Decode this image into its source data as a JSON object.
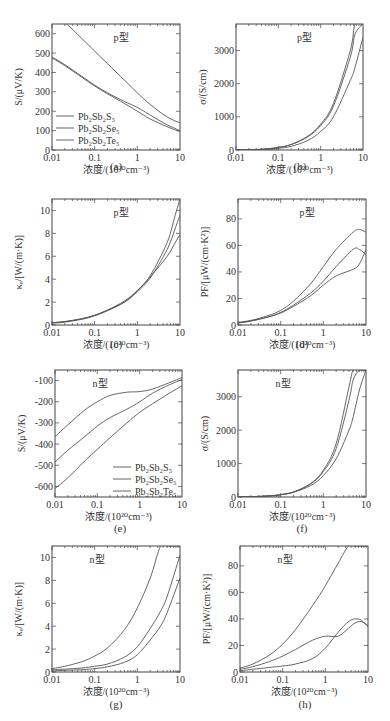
{
  "figure": {
    "xlabel": "浓度/(10²⁰cm⁻³)",
    "xticks": [
      "0.01",
      "0.1",
      "1",
      "10"
    ],
    "legend": [
      "Pb₂Sb₂S₅",
      "Pb₂Sb₂Se₅",
      "Pb₂Sb₂Te₅"
    ],
    "line_color": "#555555"
  },
  "chart_data": [
    {
      "id": "a",
      "panel_label": "(a)",
      "type": "line",
      "title": "p型",
      "ylabel": "S/(μV/K)",
      "xlabel": "浓度/(10²⁰cm⁻³)",
      "xscale": "log",
      "xlim": [
        0.01,
        10
      ],
      "ylim": [
        0,
        650
      ],
      "yticks": [
        0,
        100,
        200,
        300,
        400,
        500,
        600
      ],
      "legend_position": "lower-left",
      "x": [
        0.01,
        0.02,
        0.05,
        0.1,
        0.2,
        0.5,
        1,
        2,
        5,
        10
      ],
      "series": [
        {
          "name": "Pb₂Sb₂S₅",
          "values": [
            720,
            660,
            575,
            510,
            445,
            360,
            295,
            235,
            170,
            140
          ]
        },
        {
          "name": "Pb₂Sb₂Se₅",
          "values": [
            480,
            440,
            380,
            335,
            295,
            250,
            220,
            180,
            130,
            100
          ]
        },
        {
          "name": "Pb₂Sb₂Te₅",
          "values": [
            475,
            435,
            375,
            330,
            290,
            240,
            200,
            160,
            120,
            95
          ]
        }
      ]
    },
    {
      "id": "b",
      "panel_label": "(b)",
      "type": "line",
      "title": "p型",
      "ylabel": "σ/(S/cm)",
      "xlabel": "浓度/(10²⁰cm⁻³)",
      "xscale": "log",
      "xlim": [
        0.01,
        10
      ],
      "ylim": [
        0,
        3800
      ],
      "yticks": [
        0,
        1000,
        2000,
        3000
      ],
      "x": [
        0.01,
        0.02,
        0.05,
        0.1,
        0.2,
        0.5,
        1,
        2,
        5,
        6.5,
        10
      ],
      "series": [
        {
          "name": "Pb₂Sb₂S₅",
          "values": [
            5,
            10,
            30,
            80,
            170,
            420,
            780,
            1400,
            3000,
            3800,
            3800
          ]
        },
        {
          "name": "Pb₂Sb₂Se₅",
          "values": [
            5,
            10,
            30,
            75,
            160,
            400,
            740,
            1320,
            2800,
            3500,
            3800
          ]
        },
        {
          "name": "Pb₂Sb₂Te₅",
          "values": [
            3,
            8,
            20,
            50,
            110,
            290,
            560,
            1000,
            2100,
            2500,
            3400
          ]
        }
      ]
    },
    {
      "id": "c",
      "panel_label": "(c)",
      "type": "line",
      "title": "p型",
      "ylabel": "κₑ/[W/(m·K)]",
      "xlabel": "浓度/(10²⁰cm⁻³)",
      "xscale": "log",
      "xlim": [
        0.01,
        10
      ],
      "ylim": [
        0,
        11
      ],
      "yticks": [
        0,
        2,
        4,
        6,
        8,
        10
      ],
      "x": [
        0.01,
        0.02,
        0.05,
        0.1,
        0.2,
        0.5,
        1,
        2,
        5,
        8,
        10
      ],
      "series": [
        {
          "name": "Pb₂Sb₂S₅",
          "values": [
            0.2,
            0.3,
            0.55,
            0.85,
            1.3,
            2.1,
            3.0,
            4.3,
            7.2,
            9.8,
            11
          ]
        },
        {
          "name": "Pb₂Sb₂Se₅",
          "values": [
            0.2,
            0.3,
            0.55,
            0.85,
            1.3,
            2.0,
            2.9,
            4.1,
            6.6,
            8.6,
            9.6
          ]
        },
        {
          "name": "Pb₂Sb₂Te₅",
          "values": [
            0.15,
            0.25,
            0.5,
            0.8,
            1.25,
            2.0,
            3.0,
            4.2,
            6.0,
            7.3,
            7.9
          ]
        }
      ]
    },
    {
      "id": "d",
      "panel_label": "(d)",
      "type": "line",
      "title": "p型",
      "ylabel": "PF/[μW/(cm·K²)]",
      "xlabel": "浓度/(10²⁰cm⁻³)",
      "xscale": "log",
      "xlim": [
        0.01,
        10
      ],
      "ylim": [
        0,
        95
      ],
      "yticks": [
        0,
        20,
        40,
        60,
        80
      ],
      "x": [
        0.01,
        0.02,
        0.05,
        0.1,
        0.2,
        0.5,
        1,
        2,
        5,
        7,
        10
      ],
      "series": [
        {
          "name": "Pb₂Sb₂S₅",
          "values": [
            2,
            3.5,
            7,
            11,
            18,
            31,
            44,
            57,
            70,
            72,
            70
          ]
        },
        {
          "name": "Pb₂Sb₂Se₅",
          "values": [
            1.5,
            3,
            6,
            9.5,
            15,
            24,
            33,
            44,
            57,
            57,
            53
          ]
        },
        {
          "name": "Pb₂Sb₂Te₅",
          "values": [
            1.5,
            3,
            6,
            9,
            14,
            22,
            30,
            37,
            42,
            46,
            57
          ]
        }
      ]
    },
    {
      "id": "e",
      "panel_label": "(e)",
      "type": "line",
      "title": "n型",
      "ylabel": "S/(μV/K)",
      "xlabel": "浓度/(10²⁰cm⁻³)",
      "xscale": "log",
      "xlim": [
        0.01,
        10
      ],
      "ylim": [
        -650,
        -50
      ],
      "yticks": [
        -600,
        -500,
        -400,
        -300,
        -200,
        -100
      ],
      "legend_position": "lower-right",
      "x": [
        0.01,
        0.02,
        0.05,
        0.1,
        0.2,
        0.5,
        1,
        2,
        5,
        10
      ],
      "series": [
        {
          "name": "Pb₂Sb₂S₅",
          "values": [
            -365,
            -310,
            -240,
            -200,
            -170,
            -155,
            -152,
            -140,
            -110,
            -85
          ]
        },
        {
          "name": "Pb₂Sb₂Se₅",
          "values": [
            -485,
            -430,
            -365,
            -315,
            -275,
            -235,
            -200,
            -160,
            -120,
            -95
          ]
        },
        {
          "name": "Pb₂Sb₂Te₅",
          "values": [
            -610,
            -560,
            -480,
            -425,
            -370,
            -300,
            -250,
            -210,
            -160,
            -125
          ]
        }
      ]
    },
    {
      "id": "f",
      "panel_label": "(f)",
      "type": "line",
      "title": "n型",
      "ylabel": "σ/(S/cm)",
      "xlabel": "浓度/(10²⁰cm⁻³)",
      "xscale": "log",
      "xlim": [
        0.01,
        10
      ],
      "ylim": [
        0,
        3800
      ],
      "yticks": [
        0,
        1000,
        2000,
        3000
      ],
      "x": [
        0.01,
        0.02,
        0.05,
        0.1,
        0.2,
        0.5,
        1,
        2,
        4,
        5,
        7,
        10
      ],
      "series": [
        {
          "name": "Pb₂Sb₂S₅",
          "values": [
            5,
            10,
            30,
            70,
            150,
            400,
            800,
            1600,
            3300,
            3800,
            3800,
            3800
          ]
        },
        {
          "name": "Pb₂Sb₂Se₅",
          "values": [
            5,
            10,
            30,
            70,
            150,
            390,
            760,
            1450,
            2900,
            3500,
            3800,
            3800
          ]
        },
        {
          "name": "Pb₂Sb₂Te₅",
          "values": [
            5,
            10,
            30,
            70,
            140,
            340,
            640,
            1150,
            2000,
            2400,
            3200,
            3800
          ]
        }
      ]
    },
    {
      "id": "g",
      "panel_label": "(g)",
      "type": "line",
      "title": "n型",
      "ylabel": "κₑ/[W/(m·K)]",
      "xlabel": "浓度/(10²⁰cm⁻³)",
      "xscale": "log",
      "xlim": [
        0.01,
        10
      ],
      "ylim": [
        0,
        11
      ],
      "yticks": [
        0,
        2,
        4,
        6,
        8,
        10
      ],
      "x": [
        0.01,
        0.02,
        0.05,
        0.1,
        0.2,
        0.5,
        1,
        2,
        3.5,
        5,
        10
      ],
      "series": [
        {
          "name": "Pb₂Sb₂S₅",
          "values": [
            0.3,
            0.5,
            0.9,
            1.4,
            2.1,
            3.7,
            5.6,
            8.2,
            11,
            11,
            11
          ]
        },
        {
          "name": "Pb₂Sb₂Se₅",
          "values": [
            0.2,
            0.25,
            0.35,
            0.5,
            0.7,
            1.3,
            2.2,
            3.8,
            5.3,
            6.6,
            10.2
          ]
        },
        {
          "name": "Pb₂Sb₂Te₅",
          "values": [
            0.1,
            0.15,
            0.2,
            0.3,
            0.45,
            0.85,
            1.5,
            2.8,
            4.0,
            5.2,
            8.2
          ]
        }
      ]
    },
    {
      "id": "h",
      "panel_label": "(h)",
      "type": "line",
      "title": "n型",
      "ylabel": "PF/[μW/(cm·K²)]",
      "xlabel": "浓度/(10²⁰cm⁻³)",
      "xscale": "log",
      "xlim": [
        0.01,
        10
      ],
      "ylim": [
        0,
        95
      ],
      "yticks": [
        0,
        20,
        40,
        60,
        80
      ],
      "x": [
        0.01,
        0.02,
        0.05,
        0.1,
        0.2,
        0.5,
        1,
        2,
        3.5,
        5,
        7,
        10
      ],
      "series": [
        {
          "name": "Pb₂Sb₂S₅",
          "values": [
            3,
            6,
            13,
            21,
            32,
            50,
            65,
            82,
            95,
            95,
            95,
            95
          ]
        },
        {
          "name": "Pb₂Sb₂Se₅",
          "values": [
            2,
            4,
            8,
            12,
            17,
            24,
            27,
            27,
            33,
            37,
            38,
            35
          ]
        },
        {
          "name": "Pb₂Sb₂Te₅",
          "values": [
            1,
            2,
            3.5,
            4.5,
            6,
            10,
            18,
            30,
            38,
            40,
            39,
            34
          ]
        }
      ]
    }
  ]
}
